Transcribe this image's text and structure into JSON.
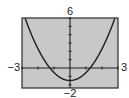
{
  "chart_data": {
    "type": "line",
    "title": "",
    "xlabel": "",
    "ylabel": "",
    "function": "y = x^2 - 2",
    "coefficients": {
      "a": 1,
      "b": 0,
      "c": -2
    },
    "xlim": [
      -3,
      3
    ],
    "ylim": [
      -2,
      6
    ],
    "xscale": 1,
    "yscale": 1,
    "grid": false,
    "series": [
      {
        "name": "y = x^2 - 2",
        "x": [
          -3,
          -2.5,
          -2,
          -1.5,
          -1,
          -0.5,
          0,
          0.5,
          1,
          1.5,
          2,
          2.5,
          3
        ],
        "values": [
          7,
          4.25,
          2,
          0.25,
          -1,
          -1.75,
          -2,
          -1.75,
          -1,
          0.25,
          2,
          4.25,
          7
        ]
      }
    ],
    "window_labels": {
      "ymax": "6",
      "ymin": "−2",
      "xmin": "−3",
      "xmax": "3"
    }
  },
  "colors": {
    "screen_bg": "#c8c8c8",
    "frame": "#2a2a2a",
    "axis": "#1e1e1e",
    "curve": "#1e1e1e",
    "page_bg": "#ffffff"
  }
}
